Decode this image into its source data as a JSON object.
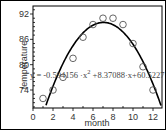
{
  "chart_data": {
    "type": "scatter",
    "title": "",
    "xlabel": "month",
    "ylabel": "temperature",
    "xlim": [
      0,
      13
    ],
    "ylim": [
      70,
      93
    ],
    "x_ticks": [
      0,
      2,
      4,
      6,
      8,
      10,
      12
    ],
    "y_ticks": [
      74,
      80,
      86,
      92
    ],
    "grid": false,
    "legend": null,
    "series": [
      {
        "name": "observed",
        "marker": "open-circle",
        "x": [
          1,
          2,
          3,
          4,
          5,
          6,
          7,
          8,
          9,
          10,
          11,
          12
        ],
        "y": [
          72,
          74,
          77,
          81.5,
          86.5,
          89.5,
          91,
          91,
          89.5,
          85,
          79.5,
          74
        ]
      },
      {
        "name": "quadratic fit",
        "type": "line",
        "equation": "y = -0.594156x^2 + 8.37088x + 60.5227",
        "coefficients": {
          "a": -0.594156,
          "b": 8.37088,
          "c": 60.5227
        }
      }
    ],
    "annotations": [
      {
        "text_parts": [
          "y = -0.594156 ·x",
          "2",
          " +8.37088·x+60.5227"
        ]
      }
    ]
  },
  "labels": {
    "xlabel": "month",
    "ylabel": "temperature",
    "eq_part1": "y = -0.594156 ·x",
    "eq_sup": "2",
    "eq_part2": " +8.37088·x+60.5227",
    "xticks": [
      "0",
      "2",
      "4",
      "6",
      "8",
      "10",
      "12"
    ],
    "yticks": [
      "74",
      "80",
      "86",
      "92"
    ]
  }
}
